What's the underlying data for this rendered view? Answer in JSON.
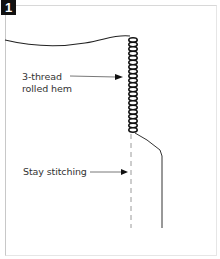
{
  "figure": {
    "step_number": "1",
    "labels": {
      "rolled_hem": [
        "3-thread",
        "rolled hem"
      ],
      "stay_stitching": "Stay stitching"
    },
    "colors": {
      "line": "#222222",
      "dashed": "#9a9a9a",
      "badge_bg": "#111111",
      "badge_text": "#ffffff"
    }
  }
}
